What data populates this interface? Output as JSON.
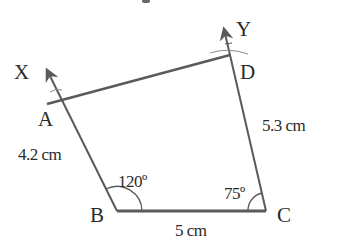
{
  "diagram": {
    "type": "quadrilateral-construction",
    "colors": {
      "line": "#5a5a5a",
      "text": "#2a2a2a",
      "background": "#ffffff"
    },
    "points": [
      {
        "id": "A",
        "label": "A"
      },
      {
        "id": "B",
        "label": "B"
      },
      {
        "id": "C",
        "label": "C"
      },
      {
        "id": "D",
        "label": "D"
      },
      {
        "id": "X",
        "label": "X"
      },
      {
        "id": "Y",
        "label": "Y"
      }
    ],
    "sides": [
      {
        "from": "A",
        "to": "B",
        "length_label": "4.2 cm"
      },
      {
        "from": "B",
        "to": "C",
        "length_label": "5 cm"
      },
      {
        "from": "C",
        "to": "D",
        "length_label": "5.3 cm"
      },
      {
        "from": "A",
        "to": "D",
        "length_label": ""
      }
    ],
    "angles": [
      {
        "vertex": "B",
        "label": "120º"
      },
      {
        "vertex": "C",
        "label": "75º"
      }
    ],
    "rays": [
      {
        "from": "B",
        "through": "A",
        "toward": "X"
      },
      {
        "from": "C",
        "through": "D",
        "toward": "Y"
      }
    ]
  }
}
